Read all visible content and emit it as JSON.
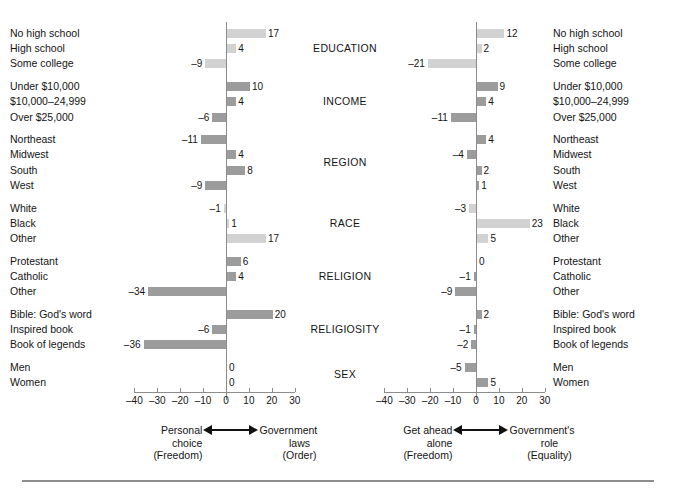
{
  "chart_data": {
    "type": "bar",
    "orientation": "horizontal",
    "title": "",
    "grid": false,
    "legend": null,
    "axis": {
      "ticks": [
        -40,
        -30,
        -20,
        -10,
        0,
        10,
        20,
        30
      ],
      "ticklabels": [
        "–40",
        "–30",
        "–20",
        "–10",
        "0",
        "10",
        "20",
        "30"
      ],
      "xlim": [
        -45,
        33
      ],
      "ylabel": "",
      "xlabel": ""
    },
    "group_labels": [
      "EDUCATION",
      "INCOME",
      "REGION",
      "RACE",
      "RELIGION",
      "RELIGIOSITY",
      "SEX"
    ],
    "groups": [
      {
        "name": "EDUCATION",
        "categories": [
          "No high school",
          "High school",
          "Some college"
        ],
        "panel1": [
          17,
          4,
          -9
        ],
        "panel2": [
          12,
          2,
          -21
        ]
      },
      {
        "name": "INCOME",
        "categories": [
          "Under $10,000",
          "$10,000–24,999",
          "Over $25,000"
        ],
        "panel1": [
          10,
          4,
          -6
        ],
        "panel2": [
          9,
          4,
          -11
        ]
      },
      {
        "name": "REGION",
        "categories": [
          "Northeast",
          "Midwest",
          "South",
          "West"
        ],
        "panel1": [
          -11,
          4,
          8,
          -9
        ],
        "panel2": [
          4,
          -4,
          2,
          1
        ]
      },
      {
        "name": "RACE",
        "categories": [
          "White",
          "Black",
          "Other"
        ],
        "panel1": [
          -1,
          1,
          17
        ],
        "panel2": [
          -3,
          23,
          5
        ]
      },
      {
        "name": "RELIGION",
        "categories": [
          "Protestant",
          "Catholic",
          "Other"
        ],
        "panel1": [
          6,
          4,
          -34
        ],
        "panel2": [
          0,
          -1,
          -9
        ]
      },
      {
        "name": "RELIGIOSITY",
        "categories": [
          "Bible: God's word",
          "Inspired book",
          "Book of legends"
        ],
        "panel1": [
          20,
          -6,
          -36
        ],
        "panel2": [
          2,
          -1,
          -2
        ]
      },
      {
        "name": "SEX",
        "categories": [
          "Men",
          "Women"
        ],
        "panel1": [
          0,
          0
        ],
        "panel2": [
          -5,
          5
        ]
      }
    ],
    "panels": [
      {
        "id": "panel1",
        "left_caption": {
          "line1": "Personal",
          "line2": "choice",
          "line3": "(Freedom)"
        },
        "right_caption": {
          "line1": "Government",
          "line2": "laws",
          "line3": "(Order)"
        }
      },
      {
        "id": "panel2",
        "left_caption": {
          "line1": "Get ahead",
          "line2": "alone",
          "line3": "(Freedom)"
        },
        "right_caption": {
          "line1": "Government's",
          "line2": "role",
          "line3": "(Equality)"
        }
      }
    ],
    "colors": {
      "bar_light": "#d2d2d2",
      "bar_medium": "#9c9c9c",
      "axis": "#8c8c8c",
      "text": "#141414",
      "rule": "#8d8d8d"
    },
    "bar_shades": {
      "EDUCATION": "light",
      "INCOME": "medium",
      "REGION": "medium",
      "RACE": "light",
      "RELIGION": "medium",
      "RELIGIOSITY": "medium",
      "SEX": "medium"
    }
  }
}
